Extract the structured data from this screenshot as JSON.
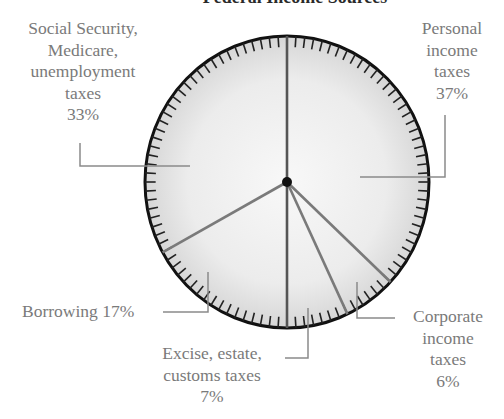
{
  "title": "Federal Income Sources",
  "colors": {
    "pie_fill_center": "#f7f7f7",
    "pie_fill_edge": "#d9d9d9",
    "pie_outline": "#111111",
    "slice_divider": "#777777",
    "leader_line": "#8a8a8a",
    "label_text": "#7a7a7a",
    "center_dot": "#111111"
  },
  "labels": {
    "social": {
      "lines": [
        "Social Security,",
        "Medicare,",
        "unemployment",
        "taxes"
      ],
      "pct": "33%"
    },
    "personal": {
      "lines": [
        "Personal",
        "income",
        "taxes"
      ],
      "pct": "37%"
    },
    "borrowing": {
      "text": "Borrowing 17%"
    },
    "excise": {
      "lines": [
        "Excise, estate,",
        "customs taxes"
      ],
      "pct": "7%"
    },
    "corporate": {
      "lines": [
        "Corporate",
        "income",
        "taxes"
      ],
      "pct": "6%"
    }
  },
  "chart_data": {
    "type": "pie",
    "title": "Federal Income Sources",
    "start_angle": "12 o'clock",
    "direction": "clockwise",
    "categories": [
      "Personal income taxes",
      "Corporate income taxes",
      "Excise, estate, customs taxes",
      "Borrowing",
      "Social Security, Medicare, unemployment taxes"
    ],
    "values": [
      37,
      6,
      7,
      17,
      33
    ],
    "unit": "%",
    "tick_marks": 100,
    "legend": "none (leader-line labels)"
  }
}
